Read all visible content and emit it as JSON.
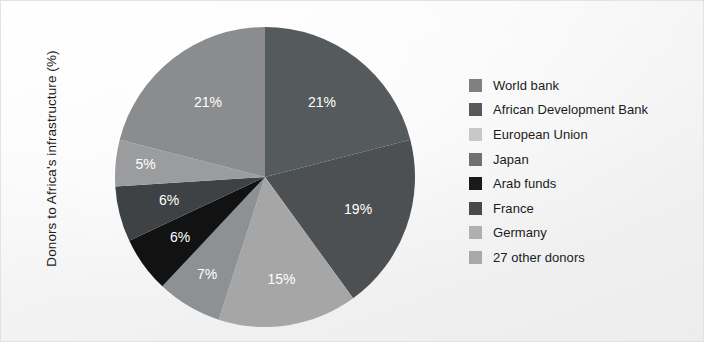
{
  "chart_data": {
    "type": "pie",
    "title": "",
    "ylabel": "Donors to Africa's infrastructure (%)",
    "xlabel": "",
    "legend_position": "right",
    "grid": false,
    "units": "%",
    "start_angle_deg": 0,
    "direction": "clockwise",
    "categories": [
      "World bank",
      "African Development Bank",
      "European Union",
      "Japan",
      "Arab funds",
      "France",
      "Germany",
      "27 other donors"
    ],
    "values": [
      21,
      19,
      15,
      7,
      6,
      6,
      5,
      21
    ],
    "data_labels": [
      "21%",
      "19%",
      "15%",
      "7%",
      "6%",
      "6%",
      "5%",
      "21%"
    ],
    "colors": [
      "#555a5c",
      "#4d5052",
      "#a6a6a6",
      "#8e9193",
      "#121212",
      "#3f4244",
      "#9a9c9e",
      "#8a8c8e"
    ]
  },
  "axis": {
    "y_title": "Donors to Africa's infrastructure (%)"
  },
  "legend": {
    "items": [
      {
        "label": "World bank",
        "swatch": "#808080"
      },
      {
        "label": "African Development Bank",
        "swatch": "#595959"
      },
      {
        "label": "European Union",
        "swatch": "#c8c8c8"
      },
      {
        "label": "Japan",
        "swatch": "#707070"
      },
      {
        "label": "Arab funds",
        "swatch": "#1a1a1a"
      },
      {
        "label": "France",
        "swatch": "#4a4a4a"
      },
      {
        "label": "Germany",
        "swatch": "#b0b0b0"
      },
      {
        "label": "27 other donors",
        "swatch": "#a8a8a8"
      }
    ]
  }
}
